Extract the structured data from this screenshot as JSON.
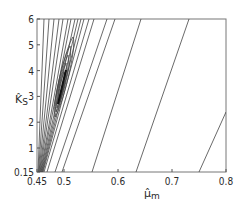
{
  "chart_data": {
    "type": "contour",
    "title": "",
    "xlabel": "μ̂m",
    "xlabel_main": "μ̂",
    "xlabel_sub": "m",
    "ylabel": "K̂s",
    "ylabel_main": "K̂",
    "ylabel_sub": "S",
    "xlim": [
      0.45,
      0.8
    ],
    "ylim": [
      0.15,
      6
    ],
    "x_ticks": [
      0.45,
      0.5,
      0.6,
      0.7,
      0.8
    ],
    "x_tick_labels": [
      "0.45",
      "0.5",
      "0.6",
      "0.7",
      "0.8"
    ],
    "y_ticks": [
      0.15,
      1,
      2,
      3,
      4,
      5,
      6
    ],
    "y_tick_labels": [
      "0.15",
      "1",
      "2",
      "3",
      "4",
      "5",
      "6"
    ],
    "grid": false,
    "legend": null,
    "minimum_region": {
      "x": [
        0.475,
        0.505
      ],
      "y": [
        2.0,
        4.0
      ]
    },
    "open_contours_top_crossings_x": [
      0.463,
      0.472,
      0.481,
      0.49,
      0.498,
      0.507,
      0.513,
      0.52,
      0.526,
      0.532,
      0.537,
      0.547,
      0.556,
      0.58,
      0.595,
      0.64,
      0.73
    ],
    "open_contours_bottom_crossings_x": [
      0.463,
      0.495,
      0.55,
      0.63,
      0.75
    ]
  }
}
